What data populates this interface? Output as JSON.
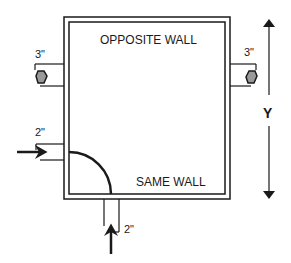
{
  "labels": {
    "opposite_wall": "OPPOSITE WALL",
    "same_wall": "SAME WALL",
    "dimension": "Y",
    "left_top_size": "3\"",
    "right_top_size": "3\"",
    "left_inlet_size": "2\"",
    "bottom_inlet_size": "2\""
  },
  "colors": {
    "line": "#1a1a1a",
    "valve_fill": "#999999",
    "background": "#ffffff"
  }
}
